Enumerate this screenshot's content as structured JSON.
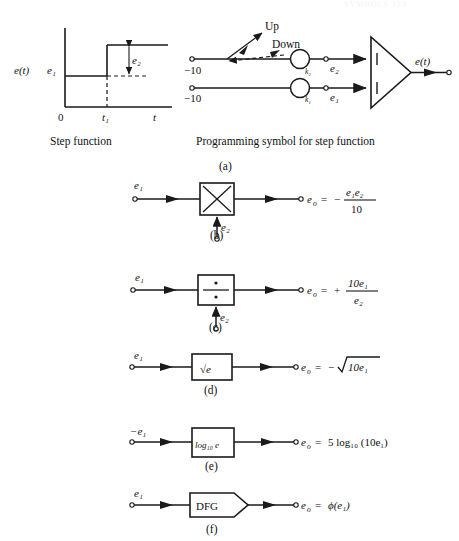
{
  "page": {
    "header_faint": "SYMBOLS   123",
    "figure_title": "Analog computer programming symbols"
  },
  "panel_a": {
    "letter": "(a)",
    "left_caption": "Step function",
    "right_caption": "Programming symbol for step function",
    "graph": {
      "y_axis_label": "e(t)",
      "level_label": "e₁",
      "step_height_label": "e₂",
      "x_origin_label": "0",
      "x_tick_label": "t₁",
      "x_axis_label": "t"
    },
    "circuit": {
      "up_label": "Up",
      "down_label": "Down",
      "source_top_label": "−10",
      "source_bottom_label": "−10",
      "pot_top_label": "k₂",
      "pot_bottom_label": "k₁",
      "node_top_label": "e₂",
      "node_bottom_label": "e₁",
      "amp_input_top": "1",
      "amp_input_bottom": "1",
      "output_label": "e(t)"
    }
  },
  "panel_b": {
    "letter": "(b)",
    "input_top": "e₁",
    "input_bottom": "e₂",
    "block": "multiplier-x-symbol",
    "output_var": "e",
    "output_sub": "o",
    "output_eq": "=",
    "output_sign": "−",
    "output_numerator": "e₁e₂",
    "output_denominator": "10"
  },
  "panel_c": {
    "letter": "(c)",
    "input_top": "e₁",
    "input_bottom": "e₂",
    "block": "divider-obelus-symbol",
    "output_var": "e",
    "output_sub": "o",
    "output_eq": "=",
    "output_sign": "+",
    "output_numerator": "10e₁",
    "output_denominator": "e₂"
  },
  "panel_d": {
    "letter": "(d)",
    "input_top": "e₁",
    "block_label": "√e",
    "output_var": "e",
    "output_sub": "o",
    "output_eq": "=",
    "output_sign": "−",
    "output_radicand": "10e₁"
  },
  "panel_e": {
    "letter": "(e)",
    "input_top": "−e₁",
    "block_label": "log₁₀ e",
    "output_var": "e",
    "output_sub": "o",
    "output_eq": "=",
    "output_expr": "5 log₁₀ (10e₁)"
  },
  "panel_f": {
    "letter": "(f)",
    "input_top": "e₁",
    "block_label": "DFG",
    "output_var": "e",
    "output_sub": "o",
    "output_eq": "=",
    "output_expr": "ϕ(e₁)"
  },
  "colors": {
    "line": "#1a1a1a",
    "background": "#ffffff"
  }
}
